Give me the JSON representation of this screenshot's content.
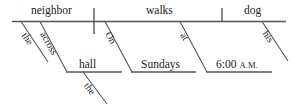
{
  "diagram": {
    "type": "reed-kellogg-sentence-diagram",
    "sentence": "The neighbor across the hall walks his dog at 6:00 A.M. on Sundays.",
    "colors": {
      "line": "#555555",
      "text": "#1a1a1a",
      "background": "#ffffff"
    },
    "baseline_words": [
      {
        "id": "subject",
        "label": "neighbor"
      },
      {
        "id": "verb",
        "label": "walks"
      },
      {
        "id": "object",
        "label": "dog"
      }
    ],
    "modifiers": [
      {
        "id": "subject-article",
        "label": "the",
        "attaches_to": "neighbor"
      },
      {
        "id": "subject-prep",
        "label": "across",
        "attaches_to": "neighbor"
      },
      {
        "id": "prep-object-hall",
        "label": "hall",
        "attaches_to": "across"
      },
      {
        "id": "hall-article",
        "label": "the",
        "attaches_to": "hall"
      },
      {
        "id": "verb-prep-on",
        "label": "On",
        "attaches_to": "walks"
      },
      {
        "id": "prep-object-sundays",
        "label": "Sundays",
        "attaches_to": "On"
      },
      {
        "id": "verb-prep-at",
        "label": "at",
        "attaches_to": "walks"
      },
      {
        "id": "prep-object-time",
        "label": "6:00",
        "label_suffix": "A.M.",
        "attaches_to": "at"
      },
      {
        "id": "object-possessive",
        "label": "his",
        "attaches_to": "dog"
      }
    ],
    "dividers": [
      {
        "id": "subject-verb-divider",
        "kind": "full-vertical"
      },
      {
        "id": "verb-object-divider",
        "kind": "half-vertical"
      }
    ]
  }
}
